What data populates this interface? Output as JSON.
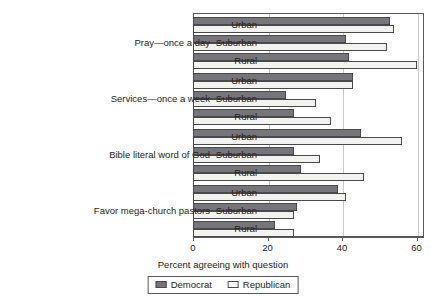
{
  "chart_data": {
    "type": "bar",
    "orientation": "horizontal",
    "title": "",
    "xlabel": "Percent agreeing with question",
    "ylabel": "",
    "xlim": [
      0,
      62
    ],
    "xticks": [
      0,
      20,
      40,
      60
    ],
    "xtick_labels": [
      "0",
      "20",
      "40",
      "60"
    ],
    "grid": true,
    "grid_axis": "x",
    "legend": {
      "position": "bottom",
      "entries": [
        {
          "name": "Democrat",
          "color": "#76767a",
          "style": "filled"
        },
        {
          "name": "Republican",
          "color": "#ffffff",
          "style": "outline"
        }
      ]
    },
    "categories": [
      "Urban",
      "Suburban",
      "Rural"
    ],
    "series": [
      {
        "name": "Democrat",
        "color": "#76767a"
      },
      {
        "name": "Republican",
        "color": "#ffffff"
      }
    ],
    "groups": [
      {
        "label": "Pray—once a day",
        "rows": [
          {
            "category": "Urban",
            "Democrat": 53,
            "Republican": 54
          },
          {
            "category": "Suburban",
            "Democrat": 41,
            "Republican": 52
          },
          {
            "category": "Rural",
            "Democrat": 42,
            "Republican": 60
          }
        ]
      },
      {
        "label": "Services—once a week",
        "rows": [
          {
            "category": "Urban",
            "Democrat": 43,
            "Republican": 43
          },
          {
            "category": "Suburban",
            "Democrat": 25,
            "Republican": 33
          },
          {
            "category": "Rural",
            "Democrat": 27,
            "Republican": 37
          }
        ]
      },
      {
        "label": "Bible literal word of God",
        "rows": [
          {
            "category": "Urban",
            "Democrat": 45,
            "Republican": 56
          },
          {
            "category": "Suburban",
            "Democrat": 27,
            "Republican": 34
          },
          {
            "category": "Rural",
            "Democrat": 29,
            "Republican": 46
          }
        ]
      },
      {
        "label": "Favor mega-church pastors",
        "rows": [
          {
            "category": "Urban",
            "Democrat": 39,
            "Republican": 41
          },
          {
            "category": "Suburban",
            "Democrat": 28,
            "Republican": 27
          },
          {
            "category": "Rural",
            "Democrat": 22,
            "Republican": 27
          }
        ]
      }
    ]
  },
  "axis": {
    "title": "Percent agreeing with question",
    "ticks": [
      "0",
      "20",
      "40",
      "60"
    ]
  },
  "legend": {
    "democrat_label": "Democrat",
    "republican_label": "Republican"
  }
}
